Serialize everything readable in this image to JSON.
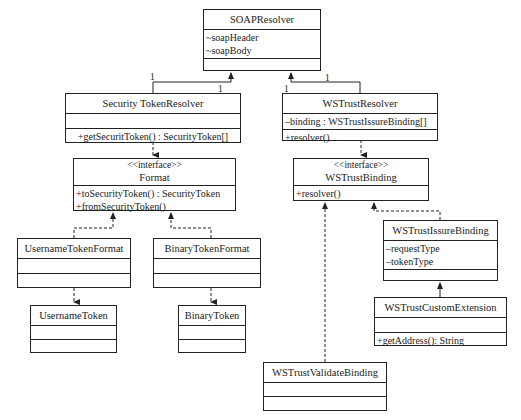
{
  "classes": {
    "soap_resolver": {
      "name": "SOAPResolver",
      "attributes": [
        "~soapHeader",
        "~soapBody"
      ],
      "methods": []
    },
    "security_token_resolver": {
      "name": "Security TokenResolver",
      "attributes": [],
      "methods": [
        "+getSecuritToken() : SecurityToken[]"
      ]
    },
    "ws_trust_resolver": {
      "name": "WSTrustResolver",
      "attributes": [
        "–binding : WSTrustIssureBinding[]"
      ],
      "methods": [
        "+resolver()"
      ]
    },
    "format": {
      "stereotype": "<<interface>>",
      "name": "Format",
      "methods": [
        "+toSecurityToken() : SecurityToken",
        "+fromSecurityToken()"
      ]
    },
    "ws_trust_binding": {
      "stereotype": "<<interface>>",
      "name": "WSTrustBinding",
      "methods": [
        "+resolver()"
      ]
    },
    "username_token_format": {
      "name": "UsernameTokenFormat",
      "attributes": [],
      "methods": []
    },
    "binary_token_format": {
      "name": "BinaryTokenFormat",
      "attributes": [],
      "methods": []
    },
    "username_token": {
      "name": "UsernameToken",
      "attributes": [],
      "methods": []
    },
    "binary_token": {
      "name": "BinaryToken",
      "attributes": [],
      "methods": []
    },
    "ws_trust_issue_binding": {
      "name": "WSTrustIssureBinding",
      "attributes": [
        "–requestType",
        "–tokenType"
      ],
      "methods": []
    },
    "ws_trust_custom_extension": {
      "name": "WSTrustCustomExtension",
      "attributes": [],
      "methods": [
        "+getAddress(): String"
      ]
    },
    "ws_trust_validate_binding": {
      "name": "WSTrustValidateBinding",
      "attributes": [],
      "methods": []
    }
  },
  "multiplicities": {
    "soap_left": "1",
    "security_resolver_end": "1",
    "soap_right": "1",
    "ws_trust_resolver_end": "1"
  },
  "colors": {
    "line": "#222222",
    "background": "#ffffff"
  }
}
